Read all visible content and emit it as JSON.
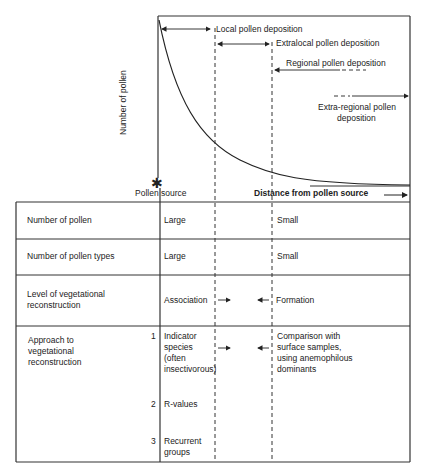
{
  "graph": {
    "y_axis_label": "Number of pollen",
    "x_axis_label": "Distance from pollen source",
    "origin_label": "Pollen source",
    "origin_icon": "star-burst",
    "zones": [
      {
        "label": "Local pollen deposition"
      },
      {
        "label": "Extralocal pollen deposition"
      },
      {
        "label": "Regional pollen deposition"
      },
      {
        "label_line1": "Extra-regional pollen",
        "label_line2": "deposition"
      }
    ]
  },
  "table": {
    "rows": [
      {
        "label": "Number of pollen",
        "near": "Large",
        "far": "Small"
      },
      {
        "label": "Number of pollen types",
        "near": "Large",
        "far": "Small"
      },
      {
        "label_line1": "Level of vegetational",
        "label_line2": "reconstruction",
        "near": "Association",
        "far": "Formation"
      },
      {
        "label_line1": "Approach to",
        "label_line2": "vegetational",
        "label_line3": "reconstruction",
        "items": [
          {
            "num": "1",
            "line1": "Indicator",
            "line2": "species",
            "line3": "(often",
            "line4": "insectivorous)"
          },
          {
            "num": "2",
            "line1": "R-values"
          },
          {
            "num": "3",
            "line1": "Recurrent",
            "line2": "groups"
          }
        ],
        "far_line1": "Comparison with",
        "far_line2": "surface samples,",
        "far_line3": "using anemophilous",
        "far_line4": "dominants"
      }
    ]
  }
}
